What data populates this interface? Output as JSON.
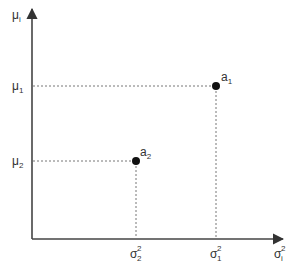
{
  "diagram": {
    "type": "scatter-schematic",
    "colors": {
      "axis": "#444444",
      "guide": "#777777",
      "point": "#111111",
      "text": "#333333"
    },
    "y_axis": {
      "label": "μ",
      "label_sub": "i"
    },
    "x_axis": {
      "label": "σ",
      "label_sup": "2",
      "label_sub": "i"
    },
    "y_ticks": [
      {
        "label": "μ",
        "sub": "1"
      },
      {
        "label": "μ",
        "sub": "2"
      }
    ],
    "x_ticks": [
      {
        "label": "σ",
        "sup": "2",
        "sub": "2"
      },
      {
        "label": "σ",
        "sup": "2",
        "sub": "1"
      }
    ],
    "points": [
      {
        "label": "a",
        "sub": "1",
        "x_ref": "σ1²",
        "y_ref": "μ1"
      },
      {
        "label": "a",
        "sub": "2",
        "x_ref": "σ2²",
        "y_ref": "μ2"
      }
    ]
  }
}
